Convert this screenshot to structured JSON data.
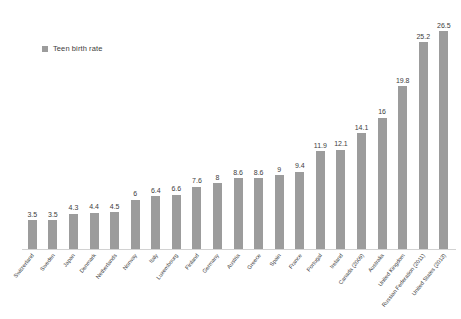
{
  "legend": {
    "position": "top-left",
    "entries": [
      {
        "label": "Teen birth rate",
        "color": "#9c9c9c",
        "marker": "square-swatch-icon"
      }
    ]
  },
  "chart_data": {
    "type": "bar",
    "title": "",
    "subtitle": "",
    "xlabel": "",
    "ylabel": "",
    "grid": false,
    "legend_position": "top-left",
    "ylim": [
      0,
      28
    ],
    "series_name": "Teen birth rate",
    "bar_color": "#9c9c9c",
    "categories": [
      "Switzerland",
      "Sweden",
      "Japan",
      "Denmark",
      "Netherlands",
      "Norway",
      "Italy",
      "Luxembourg",
      "Finland",
      "Germany",
      "Austria",
      "Greece",
      "Spain",
      "France",
      "Portugal",
      "Ireland",
      "Canada (2009)",
      "Australia",
      "United Kingdom",
      "Russian Federation (2011)",
      "United States (2013)"
    ],
    "values": [
      3.5,
      3.5,
      4.3,
      4.4,
      4.5,
      6,
      6.4,
      6.6,
      7.6,
      8,
      8.6,
      8.6,
      9,
      9.4,
      11.9,
      12.1,
      14.1,
      16,
      19.8,
      25.2,
      26.5
    ],
    "value_labels": [
      "3.5",
      "3.5",
      "4.3",
      "4.4",
      "4.5",
      "6",
      "6.4",
      "6.6",
      "7.6",
      "8",
      "8.6",
      "8.6",
      "9",
      "9.4",
      "11.9",
      "12.1",
      "14.1",
      "16",
      "19.8",
      "25.2",
      "26.5"
    ]
  },
  "colors": {
    "bar": "#9c9c9c",
    "axis": "#d2d2d2",
    "text": "#3d3d3d",
    "background": "#ffffff"
  }
}
